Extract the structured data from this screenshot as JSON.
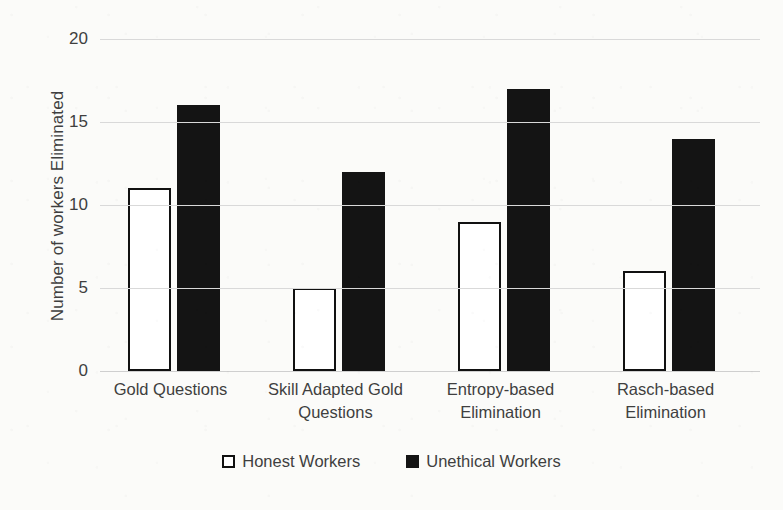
{
  "chart_data": {
    "type": "bar",
    "title": "",
    "xlabel": "",
    "ylabel": "Number of workers Eliminated",
    "ylim": [
      0,
      20
    ],
    "yticks": [
      0,
      5,
      10,
      15,
      20
    ],
    "grid": true,
    "legend_position": "bottom",
    "categories": [
      "Gold Questions",
      "Skill Adapted Gold Questions",
      "Entropy-based Elimination",
      "Rasch-based Elimination"
    ],
    "series": [
      {
        "name": "Honest Workers",
        "values": [
          11,
          5,
          9,
          6
        ],
        "color": "#ffffff",
        "edge_color": "#111111"
      },
      {
        "name": "Unethical Workers",
        "values": [
          16,
          12,
          17,
          14
        ],
        "color": "#141414",
        "edge_color": "#141414"
      }
    ]
  },
  "axis": {
    "y_title": "Number of workers Eliminated",
    "y_tick_labels": [
      "20",
      "15",
      "10",
      "5",
      "0"
    ]
  },
  "legend": {
    "items": [
      {
        "label": "Honest Workers",
        "swatch": "open-square-icon"
      },
      {
        "label": "Unethical Workers",
        "swatch": "filled-square-icon"
      }
    ]
  },
  "category_labels": [
    {
      "line1": "Gold Questions",
      "line2": ""
    },
    {
      "line1": "Skill Adapted Gold",
      "line2": "Questions"
    },
    {
      "line1": "Entropy-based",
      "line2": "Elimination"
    },
    {
      "line1": "Rasch-based",
      "line2": "Elimination"
    }
  ],
  "colors": {
    "background": "#fbfbf9",
    "text": "#3f3f3f",
    "gridline": "#d9d9d9",
    "bar_fill_dark": "#141414",
    "bar_edge": "#111111"
  }
}
